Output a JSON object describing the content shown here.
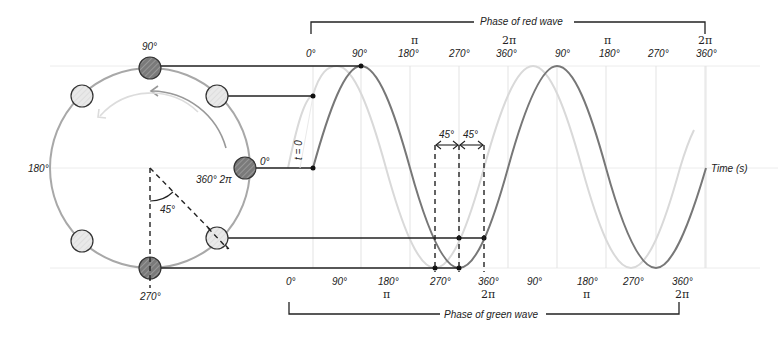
{
  "colors": {
    "red_wave": "#777777",
    "green_wave": "#d9d9d9",
    "circle": "#a8a8a8",
    "dark_dot_fill": "#7a7a7a",
    "light_dot_fill": "#e6e6e6",
    "grid": "#e3e3e3",
    "line": "#222222"
  },
  "circle": {
    "labels": {
      "top": "90°",
      "left": "180°",
      "bottom": "270°",
      "right": "0°",
      "right_inner": "360° 2π",
      "angle": "45°"
    }
  },
  "wave": {
    "t0_label": "t = 0",
    "time_axis_label": "Time (s)",
    "delta_labels": [
      "45°",
      "45°"
    ],
    "top_axis": {
      "bracket_label": "Phase of red wave",
      "ticks": [
        {
          "deg": "0°",
          "rad": ""
        },
        {
          "deg": "90°",
          "rad": ""
        },
        {
          "deg": "180°",
          "rad": "π"
        },
        {
          "deg": "270°",
          "rad": ""
        },
        {
          "deg": "360°",
          "rad": "2π"
        },
        {
          "deg": "90°",
          "rad": ""
        },
        {
          "deg": "180°",
          "rad": "π"
        },
        {
          "deg": "270°",
          "rad": ""
        },
        {
          "deg": "360°",
          "rad": "2π"
        }
      ]
    },
    "bottom_axis": {
      "bracket_label": "Phase of green wave",
      "ticks": [
        {
          "deg": "0°",
          "rad": ""
        },
        {
          "deg": "90°",
          "rad": ""
        },
        {
          "deg": "180°",
          "rad": "π"
        },
        {
          "deg": "270°",
          "rad": ""
        },
        {
          "deg": "360°",
          "rad": "2π"
        },
        {
          "deg": "90°",
          "rad": ""
        },
        {
          "deg": "180°",
          "rad": "π"
        },
        {
          "deg": "270°",
          "rad": ""
        },
        {
          "deg": "360°",
          "rad": "2π"
        }
      ]
    }
  }
}
